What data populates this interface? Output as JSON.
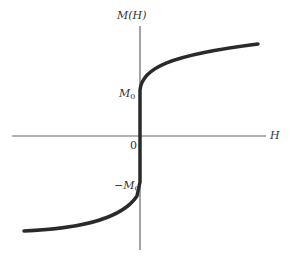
{
  "diagram": {
    "axes": {
      "y_label": "M(H)",
      "x_label": "H",
      "origin_label": "0"
    },
    "tick_labels": {
      "positive": {
        "base": "M",
        "sub": "0"
      },
      "negative": {
        "prefix": "−",
        "base": "M",
        "sub": "0"
      }
    },
    "colors": {
      "axis": "#666666",
      "curve": "#2a2a2a",
      "text": "#333333"
    }
  }
}
